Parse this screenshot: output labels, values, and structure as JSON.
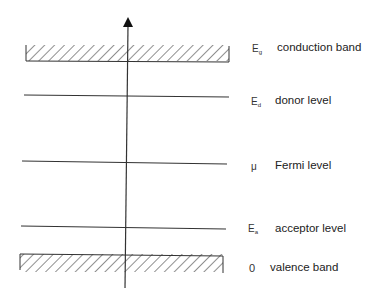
{
  "diagram": {
    "type": "energy-band-diagram",
    "axis": {
      "direction": "up",
      "label": ""
    },
    "levels": [
      {
        "id": "conduction",
        "symbol_main": "E",
        "symbol_sub": "g",
        "label": "conduction band",
        "style": "hatched-band"
      },
      {
        "id": "donor",
        "symbol_main": "E",
        "symbol_sub": "d",
        "label": "donor level",
        "style": "line"
      },
      {
        "id": "fermi",
        "symbol_main": "μ",
        "symbol_sub": "",
        "label": "Fermi level",
        "style": "line"
      },
      {
        "id": "acceptor",
        "symbol_main": "E",
        "symbol_sub": "a",
        "label": "acceptor level",
        "style": "line"
      },
      {
        "id": "valence",
        "symbol_main": "0",
        "symbol_sub": "",
        "label": "valence band",
        "style": "hatched-band"
      }
    ]
  }
}
